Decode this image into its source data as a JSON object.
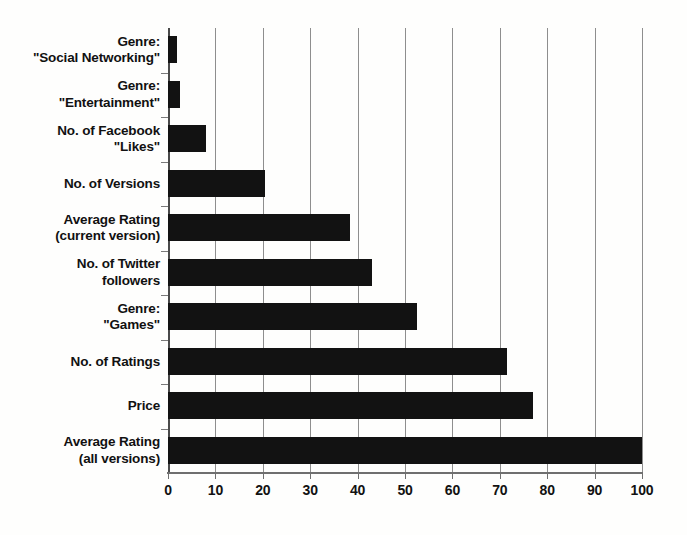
{
  "chart_data": {
    "type": "bar",
    "orientation": "horizontal",
    "title": "",
    "subtitle": "",
    "xlabel": "",
    "ylabel": "",
    "xlim": [
      0,
      100
    ],
    "ylim": null,
    "grid": true,
    "legend": false,
    "legend_position": "none",
    "xticks": [
      "0",
      "10",
      "20",
      "30",
      "40",
      "50",
      "60",
      "70",
      "80",
      "90",
      "100"
    ],
    "xtick_values": [
      0,
      10,
      20,
      30,
      40,
      50,
      60,
      70,
      80,
      90,
      100
    ],
    "categories": [
      "Genre:\n\"Social Networking\"",
      "Genre:\n\"Entertainment\"",
      "No. of Facebook\n\"Likes\"",
      "No. of Versions",
      "Average Rating\n(current version)",
      "No. of Twitter\nfollowers",
      "Genre:\n\"Games\"",
      "No. of Ratings",
      "Price",
      "Average Rating\n(all versions)"
    ],
    "values": [
      2,
      2.5,
      8,
      20.5,
      38.5,
      43,
      52.5,
      71.5,
      77,
      100
    ],
    "series": [
      {
        "name": "Relative importance",
        "values": [
          2,
          2.5,
          8,
          20.5,
          38.5,
          43,
          52.5,
          71.5,
          77,
          100
        ]
      }
    ],
    "bar_color": "#121212",
    "grid_color": "#8e8e8e",
    "axis_color": "#4a4a4a",
    "background_color": "#fefefd"
  },
  "categories_display": [
    {
      "line1": "Genre:",
      "line2": "\"Social Networking\""
    },
    {
      "line1": "Genre:",
      "line2": "\"Entertainment\""
    },
    {
      "line1": "No. of Facebook",
      "line2": "\"Likes\""
    },
    {
      "line1": "No. of Versions",
      "line2": ""
    },
    {
      "line1": "Average Rating",
      "line2": "(current version)"
    },
    {
      "line1": "No. of Twitter",
      "line2": "followers"
    },
    {
      "line1": "Genre:",
      "line2": "\"Games\""
    },
    {
      "line1": "No. of Ratings",
      "line2": ""
    },
    {
      "line1": "Price",
      "line2": ""
    },
    {
      "line1": "Average Rating",
      "line2": "(all versions)"
    }
  ]
}
